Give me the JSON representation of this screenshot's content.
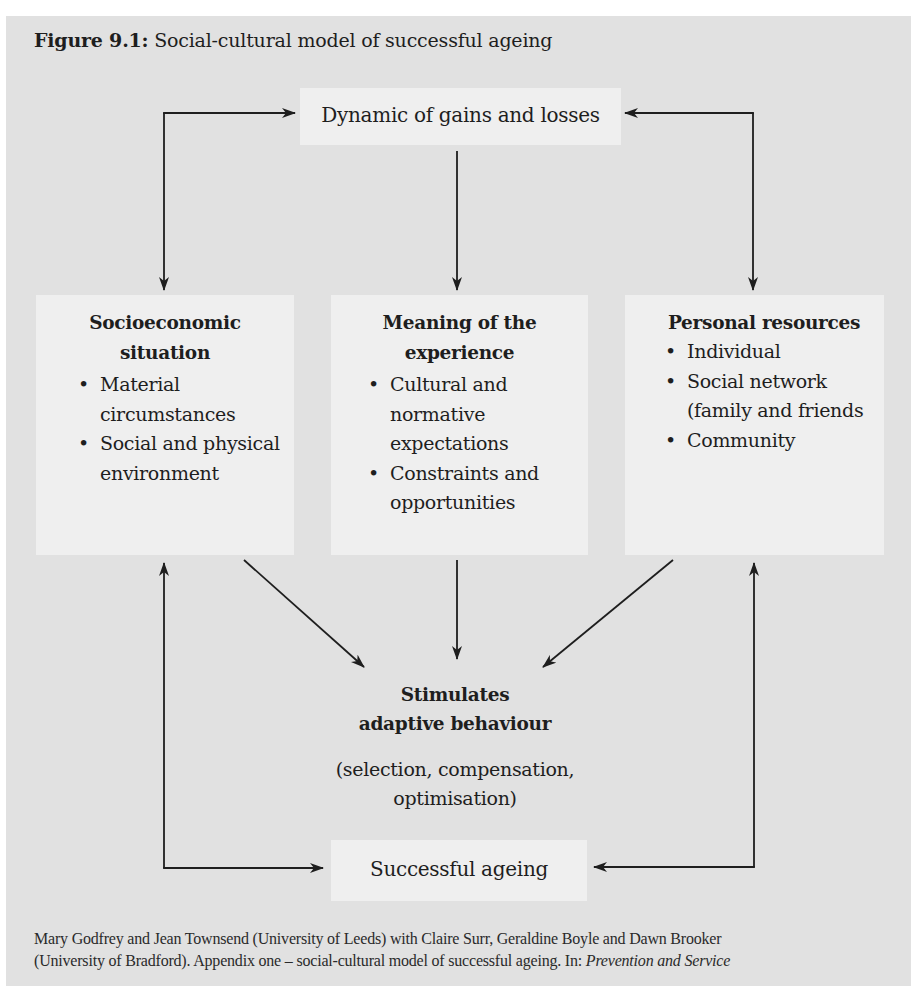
{
  "figure": {
    "label": "Figure 9.1:",
    "title": " Social-cultural model of successful ageing"
  },
  "nodes": {
    "top": {
      "label": "Dynamic of gains and losses"
    },
    "columns": [
      {
        "heading": [
          "Socioeconomic",
          "situation"
        ],
        "items": [
          "Material circumstances",
          "Social and physical environment"
        ]
      },
      {
        "heading": [
          "Meaning of the",
          "experience"
        ],
        "items": [
          "Cultural and normative expectations",
          "Constraints and opportunities"
        ]
      },
      {
        "heading": [
          "Personal resources"
        ],
        "items": [
          "Individual",
          "Social network (family and friends",
          "Community"
        ]
      }
    ],
    "adaptive": {
      "heading": [
        "Stimulates",
        "adaptive behaviour"
      ],
      "detail": [
        "(selection, compensation,",
        "optimisation)"
      ]
    },
    "bottom": {
      "label": "Successful ageing"
    }
  },
  "bullet_glyph": "•",
  "edges": [
    {
      "from": "top",
      "to": "socioeconomic",
      "type": "bidirectional-elbow"
    },
    {
      "from": "top",
      "to": "personal-resources",
      "type": "bidirectional-elbow"
    },
    {
      "from": "top",
      "to": "meaning",
      "type": "arrow"
    },
    {
      "from": "socioeconomic",
      "to": "adaptive",
      "type": "arrow"
    },
    {
      "from": "meaning",
      "to": "adaptive",
      "type": "arrow"
    },
    {
      "from": "personal-resources",
      "to": "adaptive",
      "type": "arrow"
    },
    {
      "from": "successful-ageing",
      "to": "socioeconomic",
      "type": "bidirectional-elbow"
    },
    {
      "from": "successful-ageing",
      "to": "personal-resources",
      "type": "bidirectional-elbow"
    }
  ],
  "colors": {
    "panel_bg": "#e1e1e1",
    "box_bg": "#efefef",
    "line": "#1e1e1e"
  },
  "footer": {
    "line1": "Mary Godfrey and Jean Townsend (University of Leeds) with Claire Surr, Geraldine Boyle and Dawn Brooker",
    "line2_plain": "(University of Bradford). Appendix one – social-cultural model of successful ageing. In: ",
    "line2_italic": "Prevention and Service"
  }
}
